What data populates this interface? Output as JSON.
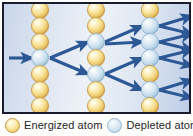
{
  "figure": {
    "frame": {
      "border_color": "#181c2e",
      "background_colors": [
        "#c9d6ea",
        "#eef2f7",
        "#bdcde6"
      ]
    }
  },
  "colors": {
    "energized_atom": "#f6dd8e",
    "energized_atom_edge": "#c2953a",
    "depleted_atom": "#cfe2ef",
    "depleted_atom_edge": "#93b6cf",
    "arrow": "#2d5896",
    "arrow_dark": "#1f3f73",
    "legend_text": "#262626"
  },
  "legend": {
    "items": [
      {
        "swatch": "energized",
        "label": "Energized atom"
      },
      {
        "swatch": "depleted",
        "label": "Depleted atom"
      }
    ]
  },
  "diagram": {
    "columns": [
      {
        "name": "column-1",
        "x": 36,
        "atoms": [
          {
            "y": 6,
            "state": "energized"
          },
          {
            "y": 22,
            "state": "energized"
          },
          {
            "y": 38,
            "state": "energized"
          },
          {
            "y": 54,
            "state": "depleted"
          },
          {
            "y": 70,
            "state": "energized"
          },
          {
            "y": 86,
            "state": "energized"
          },
          {
            "y": 102,
            "state": "energized"
          }
        ]
      },
      {
        "name": "column-2",
        "x": 92,
        "atoms": [
          {
            "y": 6,
            "state": "energized"
          },
          {
            "y": 22,
            "state": "energized"
          },
          {
            "y": 38,
            "state": "depleted"
          },
          {
            "y": 54,
            "state": "energized"
          },
          {
            "y": 70,
            "state": "depleted"
          },
          {
            "y": 86,
            "state": "energized"
          },
          {
            "y": 102,
            "state": "energized"
          }
        ]
      },
      {
        "name": "column-3",
        "x": 146,
        "atoms": [
          {
            "y": 6,
            "state": "energized"
          },
          {
            "y": 22,
            "state": "depleted"
          },
          {
            "y": 38,
            "state": "depleted"
          },
          {
            "y": 54,
            "state": "depleted"
          },
          {
            "y": 70,
            "state": "energized"
          },
          {
            "y": 86,
            "state": "depleted"
          },
          {
            "y": 102,
            "state": "energized"
          }
        ]
      }
    ],
    "atom_radius": 8.5,
    "arrows": [
      {
        "name": "incident-photon",
        "x1": 5,
        "y1": 54,
        "x2": 28,
        "y2": 54
      },
      {
        "name": "stage1-up",
        "x1": 46,
        "y1": 54,
        "x2": 84,
        "y2": 38
      },
      {
        "name": "stage1-down",
        "x1": 46,
        "y1": 54,
        "x2": 84,
        "y2": 70
      },
      {
        "name": "stage2-a-up",
        "x1": 101,
        "y1": 38,
        "x2": 138,
        "y2": 22
      },
      {
        "name": "stage2-a-flat",
        "x1": 101,
        "y1": 40,
        "x2": 138,
        "y2": 38
      },
      {
        "name": "stage2-b-up",
        "x1": 101,
        "y1": 70,
        "x2": 138,
        "y2": 54
      },
      {
        "name": "stage2-b-down",
        "x1": 101,
        "y1": 70,
        "x2": 138,
        "y2": 86
      },
      {
        "name": "exit-1",
        "x1": 155,
        "y1": 22,
        "x2": 188,
        "y2": 12
      },
      {
        "name": "exit-2",
        "x1": 155,
        "y1": 22,
        "x2": 188,
        "y2": 30
      },
      {
        "name": "exit-3",
        "x1": 155,
        "y1": 38,
        "x2": 188,
        "y2": 30
      },
      {
        "name": "exit-4",
        "x1": 155,
        "y1": 38,
        "x2": 188,
        "y2": 46
      },
      {
        "name": "exit-5",
        "x1": 155,
        "y1": 54,
        "x2": 188,
        "y2": 46
      },
      {
        "name": "exit-6",
        "x1": 155,
        "y1": 54,
        "x2": 188,
        "y2": 62
      },
      {
        "name": "exit-7",
        "x1": 155,
        "y1": 86,
        "x2": 188,
        "y2": 76
      },
      {
        "name": "exit-8",
        "x1": 155,
        "y1": 86,
        "x2": 188,
        "y2": 94
      }
    ]
  }
}
